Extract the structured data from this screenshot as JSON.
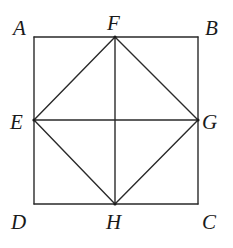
{
  "diagram": {
    "points": {
      "A": {
        "x": 34,
        "y": 37,
        "label": "A"
      },
      "B": {
        "x": 198,
        "y": 37,
        "label": "B"
      },
      "C": {
        "x": 198,
        "y": 204,
        "label": "C"
      },
      "D": {
        "x": 34,
        "y": 204,
        "label": "D"
      },
      "E": {
        "x": 34,
        "y": 120,
        "label": "E"
      },
      "F": {
        "x": 115,
        "y": 37,
        "label": "F"
      },
      "G": {
        "x": 198,
        "y": 120,
        "label": "G"
      },
      "H": {
        "x": 115,
        "y": 204,
        "label": "H"
      }
    },
    "labels": [
      {
        "id": "A",
        "text": "A",
        "x": 13,
        "y": 35
      },
      {
        "id": "F",
        "text": "F",
        "x": 107,
        "y": 30
      },
      {
        "id": "B",
        "text": "B",
        "x": 205,
        "y": 35
      },
      {
        "id": "E",
        "text": "E",
        "x": 10,
        "y": 129
      },
      {
        "id": "G",
        "text": "G",
        "x": 202,
        "y": 129
      },
      {
        "id": "D",
        "text": "D",
        "x": 11,
        "y": 229
      },
      {
        "id": "H",
        "text": "H",
        "x": 106,
        "y": 229
      },
      {
        "id": "C",
        "text": "C",
        "x": 202,
        "y": 229
      }
    ],
    "segments": [
      [
        "A",
        "B"
      ],
      [
        "B",
        "C"
      ],
      [
        "C",
        "D"
      ],
      [
        "D",
        "A"
      ],
      [
        "E",
        "F"
      ],
      [
        "F",
        "G"
      ],
      [
        "G",
        "H"
      ],
      [
        "H",
        "E"
      ],
      [
        "E",
        "G"
      ],
      [
        "F",
        "H"
      ]
    ],
    "vertex_dots": [
      "E",
      "F",
      "G",
      "H"
    ]
  }
}
